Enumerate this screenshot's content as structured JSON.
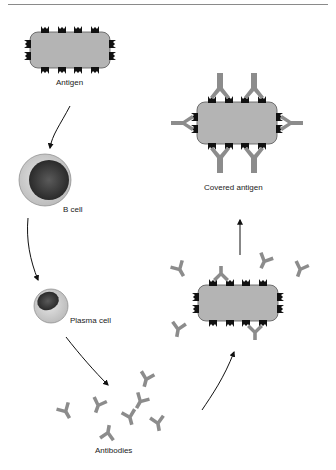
{
  "header": {
    "text": "FIGURE 4 Antibodies"
  },
  "diagram": {
    "nodes": [
      {
        "id": "antigen",
        "label": "Antigen"
      },
      {
        "id": "b_cell",
        "label": "B cell"
      },
      {
        "id": "plasma_cell",
        "label": "Plasma cell"
      },
      {
        "id": "antibodies",
        "label": "Antibodies"
      },
      {
        "id": "binding_antigen",
        "label": ""
      },
      {
        "id": "covered_antigen",
        "label": "Covered antigen"
      }
    ],
    "edges": [
      {
        "from": "antigen",
        "to": "b_cell"
      },
      {
        "from": "b_cell",
        "to": "plasma_cell"
      },
      {
        "from": "plasma_cell",
        "to": "antibodies"
      },
      {
        "from": "antibodies",
        "to": "binding_antigen"
      },
      {
        "from": "binding_antigen",
        "to": "covered_antigen"
      }
    ]
  },
  "colors": {
    "antigen_fill": "#b4b4b4",
    "antibody": "#8c8c8c",
    "epitope": "#111111",
    "nucleus": "#3a3a3a",
    "cytoplasm": "#cfcfcf"
  }
}
